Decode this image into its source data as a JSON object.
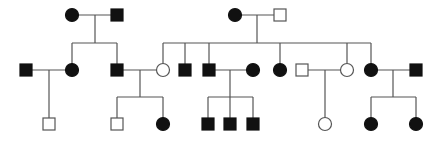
{
  "diagram": {
    "type": "pedigree",
    "colors": {
      "affected": "#111111",
      "unaffected_fill": "#ffffff",
      "line": "#555555"
    },
    "symbol_size": 12,
    "individuals": [
      {
        "id": "I-1",
        "sex": "female",
        "affected": true,
        "x": 72,
        "y": 15
      },
      {
        "id": "I-2",
        "sex": "male",
        "affected": true,
        "x": 117,
        "y": 15
      },
      {
        "id": "I-3",
        "sex": "female",
        "affected": true,
        "x": 235,
        "y": 15
      },
      {
        "id": "I-4",
        "sex": "male",
        "affected": false,
        "x": 280,
        "y": 15
      },
      {
        "id": "II-1",
        "sex": "male",
        "affected": true,
        "x": 26,
        "y": 70
      },
      {
        "id": "II-2",
        "sex": "female",
        "affected": true,
        "x": 72,
        "y": 70
      },
      {
        "id": "II-3",
        "sex": "male",
        "affected": true,
        "x": 117,
        "y": 70
      },
      {
        "id": "II-4",
        "sex": "female",
        "affected": false,
        "x": 163,
        "y": 70
      },
      {
        "id": "II-5",
        "sex": "male",
        "affected": true,
        "x": 185,
        "y": 70
      },
      {
        "id": "II-6",
        "sex": "male",
        "affected": true,
        "x": 209,
        "y": 70
      },
      {
        "id": "II-7",
        "sex": "female",
        "affected": true,
        "x": 253,
        "y": 70
      },
      {
        "id": "II-8",
        "sex": "female",
        "affected": true,
        "x": 280,
        "y": 70
      },
      {
        "id": "II-9",
        "sex": "male",
        "affected": false,
        "x": 302,
        "y": 70
      },
      {
        "id": "II-10",
        "sex": "female",
        "affected": false,
        "x": 347,
        "y": 70
      },
      {
        "id": "II-11",
        "sex": "female",
        "affected": true,
        "x": 371,
        "y": 70
      },
      {
        "id": "II-12",
        "sex": "male",
        "affected": true,
        "x": 416,
        "y": 70
      },
      {
        "id": "III-1",
        "sex": "male",
        "affected": false,
        "x": 49,
        "y": 124
      },
      {
        "id": "III-2",
        "sex": "male",
        "affected": false,
        "x": 117,
        "y": 124
      },
      {
        "id": "III-3",
        "sex": "female",
        "affected": true,
        "x": 163,
        "y": 124
      },
      {
        "id": "III-4",
        "sex": "male",
        "affected": true,
        "x": 208,
        "y": 124
      },
      {
        "id": "III-5",
        "sex": "male",
        "affected": true,
        "x": 230,
        "y": 124
      },
      {
        "id": "III-6",
        "sex": "male",
        "affected": true,
        "x": 253,
        "y": 124
      },
      {
        "id": "III-7",
        "sex": "female",
        "affected": false,
        "x": 325,
        "y": 124
      },
      {
        "id": "III-8",
        "sex": "female",
        "affected": true,
        "x": 371,
        "y": 124
      },
      {
        "id": "III-9",
        "sex": "female",
        "affected": true,
        "x": 416,
        "y": 124
      }
    ],
    "lines": [
      [
        72,
        15,
        117,
        15
      ],
      [
        95,
        15,
        95,
        43
      ],
      [
        72,
        43,
        117,
        43
      ],
      [
        72,
        43,
        72,
        70
      ],
      [
        117,
        43,
        117,
        70
      ],
      [
        235,
        15,
        280,
        15
      ],
      [
        257,
        15,
        257,
        43
      ],
      [
        163,
        43,
        371,
        43
      ],
      [
        163,
        43,
        163,
        70
      ],
      [
        185,
        43,
        185,
        70
      ],
      [
        209,
        43,
        209,
        70
      ],
      [
        280,
        43,
        280,
        70
      ],
      [
        347,
        43,
        347,
        70
      ],
      [
        371,
        43,
        371,
        70
      ],
      [
        26,
        70,
        72,
        70
      ],
      [
        49,
        70,
        49,
        124
      ],
      [
        117,
        70,
        163,
        70
      ],
      [
        140,
        70,
        140,
        97
      ],
      [
        117,
        97,
        163,
        97
      ],
      [
        117,
        97,
        117,
        124
      ],
      [
        163,
        97,
        163,
        124
      ],
      [
        209,
        70,
        253,
        70
      ],
      [
        230,
        70,
        230,
        124
      ],
      [
        208,
        97,
        253,
        97
      ],
      [
        208,
        97,
        208,
        124
      ],
      [
        253,
        97,
        253,
        124
      ],
      [
        302,
        70,
        347,
        70
      ],
      [
        325,
        70,
        325,
        124
      ],
      [
        371,
        70,
        416,
        70
      ],
      [
        393,
        70,
        393,
        97
      ],
      [
        371,
        97,
        416,
        97
      ],
      [
        371,
        97,
        371,
        124
      ],
      [
        416,
        97,
        416,
        124
      ]
    ]
  }
}
